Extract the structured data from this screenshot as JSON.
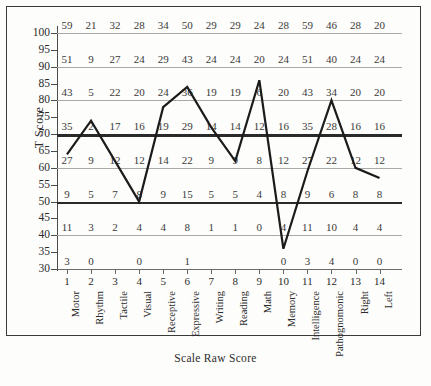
{
  "chart_data": {
    "type": "line",
    "title": "",
    "xlabel": "Scale Raw Score",
    "ylabel": "T Score",
    "ylim": [
      30,
      100
    ],
    "ytick_labels": [
      100,
      95,
      90,
      85,
      80,
      75,
      70,
      65,
      60,
      55,
      50,
      45,
      40,
      35,
      30
    ],
    "gridline_values": [
      100,
      90,
      80,
      70,
      60,
      50,
      40,
      30
    ],
    "bold_gridline_values": [
      70,
      50
    ],
    "grid": true,
    "legend": "none",
    "x_indices": [
      1,
      2,
      3,
      4,
      5,
      6,
      7,
      8,
      9,
      10,
      11,
      12,
      13,
      14
    ],
    "categories": [
      "Motor",
      "Rhythm",
      "Tactile",
      "Visual",
      "Receptive",
      "Expressive",
      "Writing",
      "Reading",
      "Math",
      "Memory",
      "Intelligence",
      "Pathognomonic",
      "Right",
      "Left"
    ],
    "raw_score_rows": [
      {
        "t_score": 100,
        "values": [
          "59",
          "21",
          "32",
          "28",
          "34",
          "50",
          "29",
          "29",
          "24",
          "28",
          "59",
          "46",
          "28",
          "20"
        ]
      },
      {
        "t_score": 90,
        "values": [
          "51",
          "9",
          "27",
          "24",
          "29",
          "43",
          "24",
          "24",
          "20",
          "24",
          "51",
          "40",
          "24",
          "24"
        ]
      },
      {
        "t_score": 80,
        "values": [
          "43",
          "5",
          "22",
          "20",
          "24",
          "36",
          "19",
          "19",
          "6",
          "20",
          "43",
          "34",
          "20",
          "20"
        ]
      },
      {
        "t_score": 70,
        "values": [
          "35",
          "2",
          "17",
          "16",
          "19",
          "29",
          "14",
          "14",
          "12",
          "16",
          "35",
          "28",
          "16",
          "16"
        ]
      },
      {
        "t_score": 60,
        "values": [
          "27",
          "9",
          "12",
          "12",
          "14",
          "22",
          "9",
          "9",
          "8",
          "12",
          "27",
          "22",
          "12",
          "12"
        ]
      },
      {
        "t_score": 50,
        "values": [
          "9",
          "5",
          "7",
          "8",
          "9",
          "15",
          "5",
          "5",
          "4",
          "8",
          "9",
          "6",
          "8",
          "8"
        ]
      },
      {
        "t_score": 40,
        "values": [
          "11",
          "3",
          "2",
          "4",
          "4",
          "8",
          "1",
          "1",
          "0",
          "4",
          "11",
          "10",
          "4",
          "4"
        ]
      },
      {
        "t_score": 30,
        "values": [
          "3",
          "0",
          "",
          "0",
          "",
          "1",
          "",
          "",
          "",
          "0",
          "3",
          "4",
          "0",
          "0"
        ]
      }
    ],
    "profile_series": {
      "name": "T Score profile",
      "values": [
        64,
        74,
        62,
        50,
        78,
        84,
        72,
        62,
        86,
        36,
        59,
        80,
        60,
        57
      ]
    },
    "colors": {
      "line": "#1b1b1b",
      "grid": "#a9a9a9",
      "grid_bold": "#2a2a2a",
      "frame": "#3a3a3a",
      "text": "#2b2b2b"
    }
  }
}
